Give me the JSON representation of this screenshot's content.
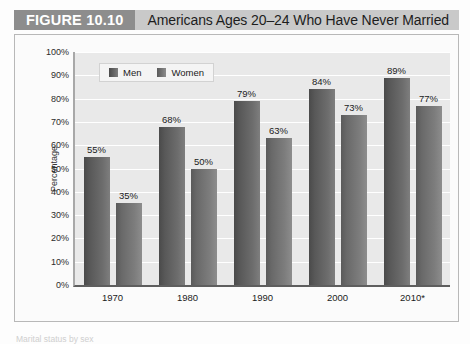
{
  "header": {
    "figure_number": "FIGURE 10.10",
    "title": "Americans Ages 20–24 Who Have Never Married"
  },
  "footnote": "Marital status by sex",
  "legend": {
    "items": [
      {
        "label": "Men",
        "color": "#5a5a5a"
      },
      {
        "label": "Women",
        "color": "#6e6e6e"
      }
    ]
  },
  "chart_data": {
    "type": "bar",
    "title": "Americans Ages 20–24 Who Have Never Married",
    "xlabel": "",
    "ylabel": "Percentage",
    "ylim": [
      0,
      100
    ],
    "grid": true,
    "legend_position": "top-left",
    "categories": [
      "1970",
      "1980",
      "1990",
      "2000",
      "2010*"
    ],
    "ytick_labels": [
      "0%",
      "10%",
      "20%",
      "30%",
      "40%",
      "50%",
      "60%",
      "70%",
      "80%",
      "90%",
      "100%"
    ],
    "ytick_values": [
      0,
      10,
      20,
      30,
      40,
      50,
      60,
      70,
      80,
      90,
      100
    ],
    "series": [
      {
        "name": "Men",
        "color": "#5a5a5a",
        "values": [
          55,
          68,
          79,
          84,
          89
        ],
        "data_labels": [
          "55%",
          "68%",
          "79%",
          "84%",
          "89%"
        ]
      },
      {
        "name": "Women",
        "color": "#6e6e6e",
        "values": [
          35,
          50,
          63,
          73,
          77
        ],
        "data_labels": [
          "35%",
          "50%",
          "63%",
          "73%",
          "77%"
        ]
      }
    ]
  }
}
